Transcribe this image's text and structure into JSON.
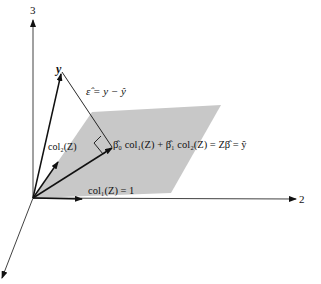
{
  "figure": {
    "axes": {
      "axis_1_label": "",
      "axis_2_label": "2",
      "axis_3_label": "3"
    },
    "vectors": {
      "y_label": "y",
      "col1_label": "col₁(Z) = 1",
      "col2_label": "col₂(Z)",
      "residual_label": "ε̂ = y − ŷ",
      "projection_label": "β̂₀ col₁(Z) + β̂₁ col₂(Z) = Zβ̂ = ŷ"
    },
    "colors": {
      "plane": "#c8c8c8",
      "lines": "#111111",
      "background": "#ffffff"
    }
  }
}
